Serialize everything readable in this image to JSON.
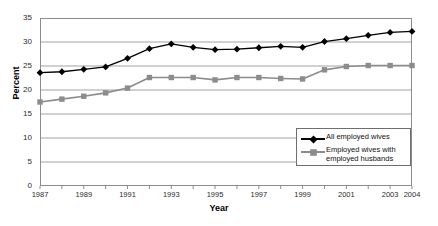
{
  "chart_data": {
    "type": "line",
    "title": "",
    "xlabel": "Year",
    "ylabel": "Percent",
    "xlim": [
      1987,
      2004
    ],
    "ylim": [
      0,
      35
    ],
    "ytick_values": [
      0,
      5,
      10,
      15,
      20,
      25,
      30,
      35
    ],
    "xtick_values": [
      1987,
      1988,
      1989,
      1990,
      1991,
      1992,
      1993,
      1994,
      1995,
      1996,
      1997,
      1998,
      1999,
      2000,
      2001,
      2002,
      2003,
      2004
    ],
    "xtick_labels": [
      "1987",
      "",
      "1989",
      "",
      "1991",
      "",
      "1993",
      "",
      "1995",
      "",
      "1997",
      "",
      "1999",
      "",
      "2001",
      "",
      "2003",
      "2004"
    ],
    "grid": "horizontal",
    "legend_position": "bottom-right",
    "x": [
      1987,
      1988,
      1989,
      1990,
      1991,
      1992,
      1993,
      1994,
      1995,
      1996,
      1997,
      1998,
      1999,
      2000,
      2001,
      2002,
      2003,
      2004
    ],
    "series": [
      {
        "name": "All employed wives",
        "color": "#000000",
        "marker": "diamond",
        "values": [
          23.6,
          23.8,
          24.3,
          24.8,
          26.6,
          28.6,
          29.6,
          28.9,
          28.4,
          28.5,
          28.8,
          29.1,
          28.9,
          30.1,
          30.7,
          31.4,
          32.0,
          32.2
        ]
      },
      {
        "name": "Employed wives with employed husbands",
        "color": "#8c8c8c",
        "marker": "square",
        "values": [
          17.5,
          18.1,
          18.7,
          19.4,
          20.4,
          22.6,
          22.6,
          22.6,
          22.1,
          22.6,
          22.6,
          22.4,
          22.3,
          24.2,
          24.9,
          25.1,
          25.1,
          25.1
        ]
      }
    ],
    "legend": [
      {
        "label": "All employed wives",
        "color": "#000000",
        "marker": "diamond"
      },
      {
        "label": "Employed wives with",
        "label2": "employed husbands",
        "color": "#8c8c8c",
        "marker": "square"
      }
    ]
  }
}
